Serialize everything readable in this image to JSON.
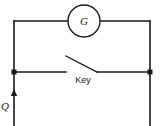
{
  "diagram": {
    "background_color": "#ffffff",
    "line_color": "#1a1a1a",
    "galvanometer": {
      "label": "G",
      "icon": "galvanometer-circle-icon",
      "center_x": 84,
      "center_y": 21,
      "radius": 16
    },
    "key": {
      "label": "Key",
      "icon": "open-switch-icon",
      "state": "open"
    },
    "charge": {
      "label": "Q",
      "icon": "up-arrow-icon",
      "direction": "up"
    },
    "nodes": [
      {
        "name": "left-junction",
        "x": 14,
        "y": 72
      },
      {
        "name": "right-junction",
        "x": 150,
        "y": 72
      }
    ],
    "wires": [
      {
        "name": "top-left-wire",
        "d": "M 14 21 L 68 21"
      },
      {
        "name": "top-right-wire",
        "d": "M 100 21 L 150 21"
      },
      {
        "name": "left-vertical-wire",
        "d": "M 14 21 L 14 126"
      },
      {
        "name": "right-vertical-wire",
        "d": "M 150 21 L 150 126"
      },
      {
        "name": "key-left-contact-wire",
        "d": "M 14 72 L 66 72"
      },
      {
        "name": "key-right-contact-wire",
        "d": "M 97 72 L 150 72"
      },
      {
        "name": "key-lever",
        "d": "M 66 56 L 97 72"
      }
    ]
  }
}
